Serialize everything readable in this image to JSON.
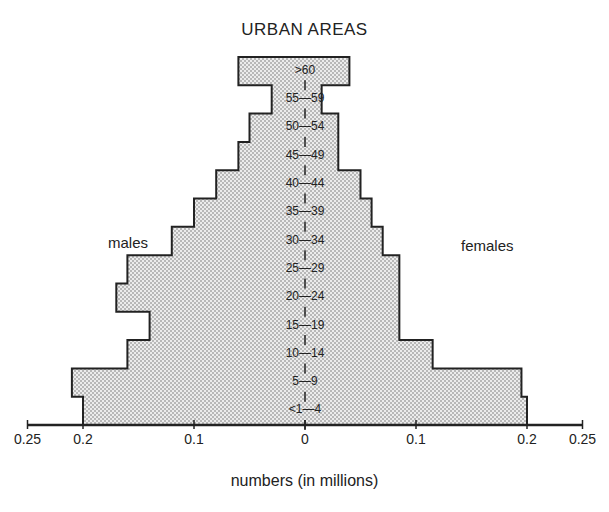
{
  "chart_data": {
    "type": "bar",
    "subtype": "population-pyramid",
    "title": "URBAN AREAS",
    "xlabel": "numbers (in millions)",
    "ylabel": "",
    "xlim": [
      -0.25,
      0.25
    ],
    "x_ticks": [
      "0.25",
      "0.2",
      "0.1",
      "0",
      "0.1",
      "0.2",
      "0.25"
    ],
    "x_tick_values": [
      -0.25,
      -0.2,
      -0.1,
      0,
      0.1,
      0.2,
      0.25
    ],
    "grid": false,
    "legend": "none",
    "side_labels": {
      "left": "males",
      "right": "females"
    },
    "categories": [
      ">60",
      "55—59",
      "50—54",
      "45—49",
      "40—44",
      "35—39",
      "30—34",
      "25—29",
      "20—24",
      "15—19",
      "10—14",
      "5—9",
      "<1—4"
    ],
    "series": [
      {
        "name": "males",
        "values": [
          0.06,
          0.03,
          0.05,
          0.06,
          0.08,
          0.1,
          0.12,
          0.16,
          0.17,
          0.14,
          0.16,
          0.21,
          0.2
        ]
      },
      {
        "name": "females",
        "values": [
          0.04,
          0.015,
          0.03,
          0.03,
          0.05,
          0.06,
          0.07,
          0.085,
          0.085,
          0.085,
          0.115,
          0.195,
          0.2
        ]
      }
    ],
    "fill": "#d9d9d9",
    "stroke": "#222222"
  }
}
